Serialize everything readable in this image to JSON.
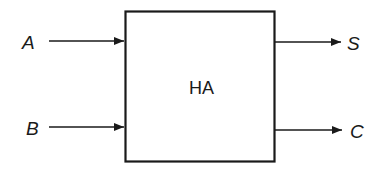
{
  "diagram": {
    "block": {
      "label": "HA"
    },
    "inputs": [
      {
        "label": "A"
      },
      {
        "label": "B"
      }
    ],
    "outputs": [
      {
        "label": "S"
      },
      {
        "label": "C"
      }
    ],
    "colors": {
      "stroke": "#1a1a1a",
      "background": "#ffffff"
    }
  }
}
